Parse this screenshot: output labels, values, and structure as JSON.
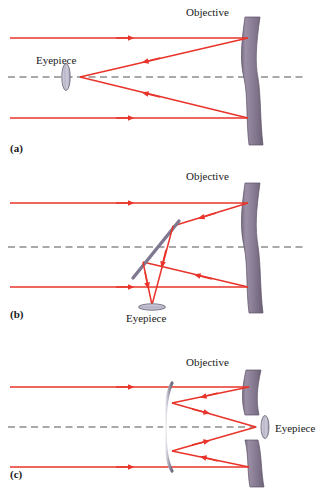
{
  "figure": {
    "width": 317,
    "height": 493,
    "background": "#ffffff"
  },
  "colors": {
    "ray": "#e8342a",
    "ray_light": "#ef5b52",
    "mirror_body": "#8b7f95",
    "mirror_body_dark": "#6f6379",
    "mirror_body_light": "#a79bb0",
    "mirror_edge": "#5d5266",
    "axis": "#555555",
    "secondary_flat": "#7d7788",
    "lens_glass": "#c9c6d6",
    "lens_stroke": "#6e6a7c",
    "text": "#1a1a1a"
  },
  "panels": [
    {
      "id": "panel-a",
      "label": "(a)",
      "label_x": 10,
      "label_y": 152,
      "type": "prime-focus",
      "objective_label": "Objective",
      "objective_label_x": 186,
      "objective_label_y": 16,
      "eyepiece_label": "Eyepiece",
      "eyepiece_label_x": 36,
      "eyepiece_label_y": 64,
      "axis_y": 77,
      "axis_x1": 8,
      "axis_x2": 305,
      "incoming_rays_y": [
        38,
        118
      ],
      "focus_x": 80,
      "focus_y": 77,
      "eyepiece": {
        "orientation": "vertical",
        "cx": 66,
        "cy": 77,
        "rx": 4,
        "ry": 13
      },
      "objective": {
        "x": 243,
        "top": 16,
        "bottom": 145,
        "curve": "concave-left"
      }
    },
    {
      "id": "panel-b",
      "label": "(b)",
      "label_x": 10,
      "label_y": 318,
      "type": "newtonian",
      "objective_label": "Objective",
      "objective_label_x": 186,
      "objective_label_y": 180,
      "eyepiece_label": "Eyepiece",
      "eyepiece_label_x": 128,
      "eyepiece_label_y": 320,
      "axis_y": 247,
      "axis_x1": 8,
      "axis_x2": 305,
      "incoming_rays_y": [
        203,
        287
      ],
      "secondary_mirror": {
        "type": "flat-diagonal",
        "x1": 133,
        "y1": 277,
        "x2": 178,
        "y2": 222
      },
      "eyepiece": {
        "orientation": "horizontal",
        "cx": 152,
        "cy": 306,
        "rx": 13,
        "ry": 3
      },
      "objective": {
        "x": 243,
        "top": 182,
        "bottom": 313,
        "curve": "concave-left"
      }
    },
    {
      "id": "panel-c",
      "label": "(c)",
      "label_x": 10,
      "label_y": 478,
      "type": "cassegrain",
      "objective_label": "Objective",
      "objective_label_x": 186,
      "objective_label_y": 366,
      "eyepiece_label": "Eyepiece",
      "eyepiece_label_x": 278,
      "eyepiece_label_y": 432,
      "axis_y": 427,
      "axis_x1": 8,
      "axis_x2": 258,
      "incoming_rays_y": [
        387,
        467
      ],
      "secondary_mirror": {
        "type": "convex",
        "x": 166,
        "top": 383,
        "bottom": 470
      },
      "eyepiece": {
        "orientation": "vertical",
        "cx": 263,
        "cy": 427,
        "rx": 4,
        "ry": 11
      },
      "objective": {
        "x": 243,
        "upper_top": 369,
        "upper_bottom": 415,
        "lower_top": 440,
        "lower_bottom": 486,
        "curve": "concave-left",
        "has_central_hole": true
      }
    }
  ],
  "legend": {
    "objective_text": "Objective",
    "eyepiece_text": "Eyepiece"
  }
}
